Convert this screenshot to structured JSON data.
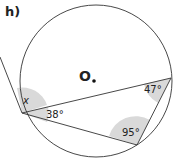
{
  "problem_label": "h)",
  "center_label": "O",
  "angles": {
    "unknown": "x",
    "left_inner": "38°",
    "right": "47°",
    "bottom": "95°"
  },
  "colors": {
    "line": "#333333",
    "angle_shade": "#d9d9d9",
    "text": "#222222"
  }
}
